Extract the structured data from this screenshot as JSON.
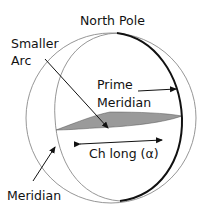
{
  "labels": {
    "north_pole": "North Pole",
    "smaller_arc_line1": "Smaller",
    "smaller_arc_line2": "Arc",
    "prime_meridian_line1": "Prime",
    "prime_meridian_line2": "Meridian",
    "ch_long": "Ch long (α)",
    "meridian": "Meridian"
  },
  "colors": {
    "outline_thin": "#8a8a8a",
    "outline_thick": "#111111",
    "wedge_fill": "#9a9a9a",
    "text": "#111111",
    "background": "#ffffff"
  }
}
